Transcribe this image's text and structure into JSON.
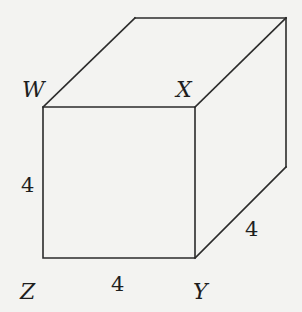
{
  "diagram": {
    "type": "cube",
    "vertices": {
      "W": "W",
      "X": "X",
      "Y": "Y",
      "Z": "Z"
    },
    "dimensions": {
      "height": "4",
      "width": "4",
      "depth": "4"
    },
    "colors": {
      "background": "#f3f3f1",
      "stroke": "#2b2b2b",
      "text": "#1e1e1e"
    }
  }
}
